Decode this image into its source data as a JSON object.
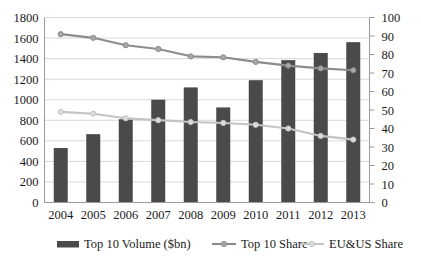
{
  "chart_data": {
    "type": "bar",
    "title": "",
    "xlabel": "",
    "ylabel": "",
    "grid": true,
    "legend_position": "bottom",
    "categories": [
      "2004",
      "2005",
      "2006",
      "2007",
      "2008",
      "2009",
      "2010",
      "2011",
      "2012",
      "2013"
    ],
    "axes": {
      "left": {
        "label": "",
        "min": 0,
        "max": 1800,
        "step": 200,
        "ticks": [
          "0",
          "200",
          "400",
          "600",
          "800",
          "1000",
          "1200",
          "1400",
          "1600",
          "1800"
        ]
      },
      "right": {
        "label": "",
        "min": 0,
        "max": 100,
        "step": 10,
        "ticks": [
          "0",
          "10",
          "20",
          "30",
          "40",
          "50",
          "60",
          "70",
          "80",
          "90",
          "100"
        ]
      }
    },
    "series": [
      {
        "name": "Top 10 Volume ($bn)",
        "type": "bar",
        "axis": "left",
        "color": "#4a4a4a",
        "values": [
          530,
          665,
          810,
          1000,
          1120,
          925,
          1190,
          1385,
          1455,
          1560
        ]
      },
      {
        "name": "Top 10 Share",
        "type": "line",
        "axis": "right",
        "color": "#8c8c8c",
        "values": [
          91,
          89,
          85,
          83,
          79,
          78.5,
          76,
          74,
          72.5,
          71.5
        ]
      },
      {
        "name": "EU&US Share",
        "type": "line",
        "axis": "right",
        "color": "#c3c3c3",
        "values": [
          49,
          48,
          45.5,
          44.5,
          43.5,
          43,
          42,
          40,
          36,
          34
        ]
      }
    ]
  },
  "legend": {
    "items": [
      {
        "label": "Top 10 Volume ($bn)",
        "marker": "bar-swatch"
      },
      {
        "label": "Top 10 Share",
        "marker": "line-marker"
      },
      {
        "label": "EU&US Share",
        "marker": "line-marker"
      }
    ]
  },
  "colors": {
    "bar": "#4a4a4a",
    "line_top10": "#8c8c8c",
    "line_euus": "#c3c3c3",
    "grid": "#d9d9d9",
    "axis": "#9a9a9a",
    "text": "#1a1a1a",
    "background": "#ffffff"
  }
}
